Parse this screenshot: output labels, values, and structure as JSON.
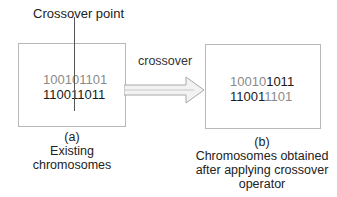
{
  "diagram": {
    "crossover_point_label": "Crossover point",
    "arrow_label": "crossover",
    "left_box": {
      "parent1": {
        "head": "10010",
        "tail": "1101"
      },
      "parent2": {
        "head": "11001",
        "tail": "1011"
      },
      "caption_tag": "(a)",
      "caption_line1": "Existing",
      "caption_line2": "chromosomes"
    },
    "right_box": {
      "child1": {
        "head": "10010",
        "tail": "1011"
      },
      "child2": {
        "head": "11001",
        "tail": "1101"
      },
      "caption_tag": "(b)",
      "caption_line1": "Chromosomes obtained",
      "caption_line2": "after applying crossover",
      "caption_line3": "operator"
    },
    "colors": {
      "box_border": "#b8b8b8",
      "grey_bits": "#8a8a8a",
      "dark_bits": "#1a1a1a",
      "arrow": "#b0b0b0"
    }
  }
}
